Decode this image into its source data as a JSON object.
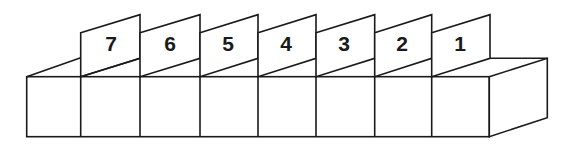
{
  "diagram": {
    "stroke_color": "#1a1a1a",
    "fill_color": "#ffffff",
    "cards": [
      {
        "label": "7"
      },
      {
        "label": "6"
      },
      {
        "label": "5"
      },
      {
        "label": "4"
      },
      {
        "label": "3"
      },
      {
        "label": "2"
      },
      {
        "label": "1"
      }
    ]
  }
}
